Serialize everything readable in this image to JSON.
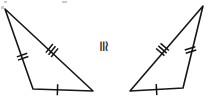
{
  "figure": {
    "type": "geometry-diagram",
    "width": 208,
    "height": 98,
    "background_color": "#ffffff",
    "stroke_color": "#161616"
  },
  "relation": {
    "symbol": "≅",
    "name": "congruent-to",
    "rotation_degrees": 90,
    "x": 103,
    "y": 46
  },
  "triangles": [
    {
      "id": "left-triangle",
      "label": "left",
      "vertices": [
        {
          "name": "apex",
          "x": 5,
          "y": 9
        },
        {
          "name": "bottom-left",
          "x": 33,
          "y": 89
        },
        {
          "name": "bottom-right",
          "x": 93,
          "y": 91
        }
      ],
      "path": "M 5 9 L 33 89 L 93 91 Z",
      "stroke_width": 1.6,
      "sides": [
        {
          "name": "left-side",
          "from": "apex",
          "to": "bottom-left",
          "tick_count": 2,
          "tick_label": "double-tick",
          "tick_x": 22.6,
          "tick_y": 56.7,
          "tick_angle_deg": 70.7,
          "tick_length": 11,
          "tick_gap": 3.4
        },
        {
          "name": "hypotenuse",
          "from": "apex",
          "to": "bottom-right",
          "tick_count": 3,
          "tick_label": "triple-tick",
          "tick_x": 52.0,
          "tick_y": 50.5,
          "tick_angle_deg": 39.1,
          "tick_length": 11,
          "tick_gap": 3.4
        },
        {
          "name": "bottom-side",
          "from": "bottom-left",
          "to": "bottom-right",
          "tick_count": 1,
          "tick_label": "single-tick",
          "tick_x": 57.5,
          "tick_y": 89.8,
          "tick_angle_deg": 1.9,
          "tick_length": 11,
          "tick_gap": 3.4
        }
      ]
    },
    {
      "id": "right-triangle",
      "label": "right",
      "vertices": [
        {
          "name": "apex",
          "x": 203,
          "y": 6
        },
        {
          "name": "bottom-left",
          "x": 130,
          "y": 91
        },
        {
          "name": "bottom-right",
          "x": 183,
          "y": 88
        }
      ],
      "path": "M 203 6 L 130 91 L 183 88 Z",
      "stroke_width": 1.6,
      "sides": [
        {
          "name": "long-side",
          "from": "apex",
          "to": "bottom-left",
          "tick_count": 3,
          "tick_label": "triple-tick",
          "tick_x": 162.5,
          "tick_y": 49.5,
          "tick_angle_deg": 130.7,
          "tick_length": 11,
          "tick_gap": 3.4
        },
        {
          "name": "right-side",
          "from": "apex",
          "to": "bottom-right",
          "tick_count": 2,
          "tick_label": "double-tick",
          "tick_x": 190.5,
          "tick_y": 50.0,
          "tick_angle_deg": 73.7,
          "tick_length": 11,
          "tick_gap": 3.4
        },
        {
          "name": "bottom-side",
          "from": "bottom-left",
          "to": "bottom-right",
          "tick_count": 1,
          "tick_label": "single-tick",
          "tick_x": 156.5,
          "tick_y": 89.6,
          "tick_angle_deg": -3.2,
          "tick_length": 11,
          "tick_gap": 3.4
        }
      ]
    }
  ],
  "artifacts": [
    {
      "name": "scan-speck-left",
      "x": 4,
      "y": 1,
      "w": 3,
      "h": 2
    },
    {
      "name": "scan-speck-mid",
      "x": 62,
      "y": 1,
      "w": 5,
      "h": 2
    },
    {
      "name": "scan-speck-right",
      "x": 1,
      "y": 6,
      "w": 3,
      "h": 3
    }
  ]
}
